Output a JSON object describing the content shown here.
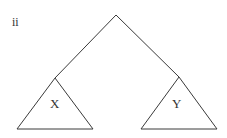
{
  "diagram": {
    "panel_label": "ii",
    "stroke_color": "#3a3a3a",
    "root": {
      "x": 116,
      "y": 15
    },
    "left_subtree": {
      "label": "X",
      "apex": {
        "x": 55,
        "y": 78
      },
      "base_left": {
        "x": 17,
        "y": 129
      },
      "base_right": {
        "x": 93,
        "y": 129
      }
    },
    "right_subtree": {
      "label": "Y",
      "apex": {
        "x": 179,
        "y": 77
      },
      "base_left": {
        "x": 141,
        "y": 129
      },
      "base_right": {
        "x": 217,
        "y": 129
      }
    }
  }
}
